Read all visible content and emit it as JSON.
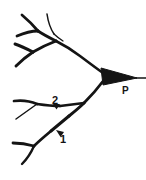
{
  "figure": {
    "background_color": "#ffffff",
    "ink_color": "#141414",
    "width": 146,
    "height": 180
  },
  "labels": {
    "soma": "P",
    "marker_one": "1",
    "marker_two": "2"
  },
  "annotations": {
    "soma_label_meaning": "pyramidal soma",
    "marker_one_meaning": "dendritic site 1",
    "marker_two_meaning": "dendritic site 2"
  },
  "icons": {
    "soma": "filled-triangle-soma-icon",
    "arrow_one": "arrowhead-up-left-icon",
    "arrow_two": "arrowhead-down-icon",
    "dendrites": "dendrite-branches-icon",
    "axon": "axon-line-icon"
  }
}
